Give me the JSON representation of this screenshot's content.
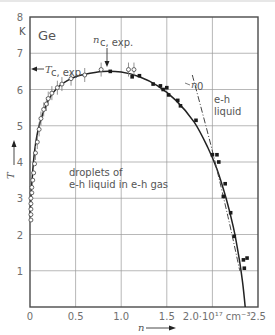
{
  "chart_data": {
    "type": "scatter",
    "title": "Ge",
    "xlabel": "n",
    "ylabel": "T",
    "x_unit": "10^17 cm^-3",
    "y_unit": "K",
    "xlim": [
      0,
      2.5
    ],
    "ylim": [
      0,
      8
    ],
    "x_ticks": [
      "0",
      "0.5",
      "1.0",
      "1.5",
      "2.0·10¹⁷ cm⁻³",
      "2.5"
    ],
    "x_tick_values": [
      0,
      0.5,
      1.0,
      1.5,
      2.0,
      2.5
    ],
    "y_ticks": [
      "1",
      "2",
      "3",
      "4",
      "5",
      "6",
      "7",
      "8"
    ],
    "y_tick_values": [
      1,
      2,
      3,
      4,
      5,
      6,
      7,
      8
    ],
    "y_unit_label": "K",
    "grid": true,
    "annotations": [
      {
        "text": "Ge",
        "x": 0.05,
        "y": 7.5
      },
      {
        "text": "n_c,exp.",
        "x": 0.85,
        "y": 7.1,
        "arrow_to": [
          0.85,
          6.65
        ]
      },
      {
        "text": "T_c,exp.",
        "x": 0.15,
        "y": 6.6,
        "arrow_to": [
          0.0,
          6.65
        ]
      },
      {
        "text": "n_0",
        "x": 1.92,
        "y": 6.15
      },
      {
        "text": "e-h liquid",
        "x": 2.1,
        "y": 5.3
      },
      {
        "text": "droplets of e-h liquid in e-h gas",
        "x": 0.5,
        "y": 3.7
      }
    ],
    "series": [
      {
        "name": "open circles (with error bars)",
        "marker": "open-circle",
        "points": [
          [
            0.01,
            2.4
          ],
          [
            0.01,
            2.55
          ],
          [
            0.01,
            2.7
          ],
          [
            0.01,
            2.85
          ],
          [
            0.01,
            3.0
          ],
          [
            0.02,
            3.15
          ],
          [
            0.02,
            3.3
          ],
          [
            0.03,
            3.5
          ],
          [
            0.04,
            3.7
          ],
          [
            0.05,
            3.95
          ],
          [
            0.06,
            4.25
          ],
          [
            0.08,
            4.55
          ],
          [
            0.1,
            4.9
          ],
          [
            0.12,
            5.2
          ],
          [
            0.15,
            5.45
          ],
          [
            0.18,
            5.6
          ],
          [
            0.2,
            5.75
          ],
          [
            0.24,
            5.9
          ],
          [
            0.3,
            6.05
          ],
          [
            0.35,
            6.15
          ],
          [
            0.45,
            6.3
          ],
          [
            0.6,
            6.4
          ],
          [
            0.78,
            6.55
          ],
          [
            1.08,
            6.55
          ],
          [
            1.14,
            6.55
          ]
        ]
      },
      {
        "name": "filled dots",
        "marker": "filled-circle",
        "points": [
          [
            0.88,
            6.5
          ],
          [
            1.12,
            6.35
          ],
          [
            1.2,
            6.38
          ],
          [
            1.35,
            6.15
          ],
          [
            1.43,
            6.1
          ],
          [
            1.46,
            6.0
          ],
          [
            1.5,
            6.05
          ],
          [
            1.52,
            5.85
          ],
          [
            1.62,
            5.7
          ],
          [
            1.65,
            5.55
          ],
          [
            1.82,
            5.15
          ],
          [
            2.0,
            4.2
          ],
          [
            2.05,
            4.2
          ],
          [
            2.07,
            4.0
          ],
          [
            2.14,
            3.4
          ],
          [
            2.12,
            3.05
          ],
          [
            2.2,
            2.6
          ],
          [
            2.24,
            1.95
          ],
          [
            2.34,
            1.3
          ],
          [
            2.38,
            1.35
          ],
          [
            2.35,
            1.07
          ]
        ]
      },
      {
        "name": "coexistence curve (fit)",
        "marker": "line",
        "points": [
          [
            0.0,
            2.5
          ],
          [
            0.02,
            3.4
          ],
          [
            0.05,
            4.3
          ],
          [
            0.1,
            5.0
          ],
          [
            0.2,
            5.7
          ],
          [
            0.3,
            6.05
          ],
          [
            0.45,
            6.3
          ],
          [
            0.6,
            6.42
          ],
          [
            0.8,
            6.5
          ],
          [
            1.0,
            6.48
          ],
          [
            1.2,
            6.35
          ],
          [
            1.4,
            6.1
          ],
          [
            1.6,
            5.7
          ],
          [
            1.8,
            5.1
          ],
          [
            1.95,
            4.4
          ],
          [
            2.05,
            3.8
          ],
          [
            2.15,
            3.0
          ],
          [
            2.23,
            2.2
          ],
          [
            2.29,
            1.4
          ],
          [
            2.33,
            0.7
          ],
          [
            2.36,
            0.0
          ]
        ]
      },
      {
        "name": "n_0",
        "marker": "dash-dot",
        "points": [
          [
            1.78,
            6.4
          ],
          [
            2.0,
            4.3
          ],
          [
            2.17,
            2.5
          ],
          [
            2.3,
            1.0
          ]
        ]
      }
    ]
  },
  "labels": {
    "title": "Ge",
    "y_unit": "K",
    "x_axis": "n",
    "y_axis": "T",
    "nc_exp": "n",
    "nc_exp_sub": "c, exp.",
    "tc_exp": "T",
    "tc_exp_sub": "c, exp.",
    "n0": "n",
    "n0_sub": "0",
    "eh_liquid_1": "e-h",
    "eh_liquid_2": "liquid",
    "droplets_1": "droplets of",
    "droplets_2": "e-h liquid in e-h gas"
  }
}
